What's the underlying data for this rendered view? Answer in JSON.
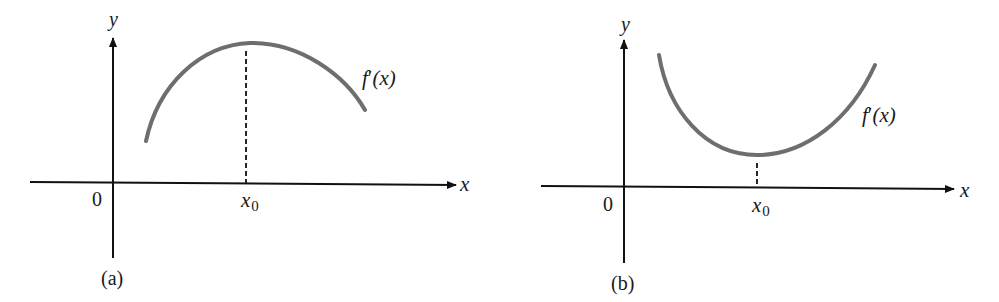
{
  "figure": {
    "panels": [
      {
        "id": "a",
        "caption": "(a)",
        "curve_label_f": "f",
        "curve_label_prime": "′",
        "curve_label_arg": "(x)",
        "x_axis_label": "x",
        "y_axis_label": "y",
        "origin_label": "0",
        "marker_label_base": "x",
        "marker_label_sub": "0",
        "description": "Concave-down curve f'(x) with a maximum at x0"
      },
      {
        "id": "b",
        "caption": "(b)",
        "curve_label_f": "f",
        "curve_label_prime": "′",
        "curve_label_arg": "(x)",
        "x_axis_label": "x",
        "y_axis_label": "y",
        "origin_label": "0",
        "marker_label_base": "x",
        "marker_label_sub": "0",
        "description": "Concave-up curve f'(x) with a minimum at x0"
      }
    ],
    "colors": {
      "axis": "#111111",
      "curve": "#6e6e6e",
      "dashed": "#111111",
      "text": "#1a1a1a",
      "background": "#ffffff"
    }
  }
}
